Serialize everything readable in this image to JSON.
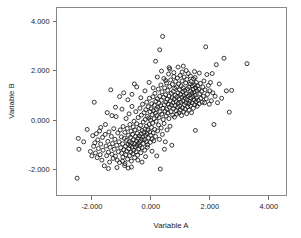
{
  "chart_data": {
    "type": "scatter",
    "title": "",
    "xlabel": "Variable A",
    "ylabel": "Variable B",
    "xlim": [
      -3.2,
      4.6
    ],
    "ylim": [
      -3.05,
      4.55
    ],
    "xticks": [
      -2.0,
      0.0,
      2.0,
      4.0
    ],
    "xticklabels": [
      "-2.000",
      "0.000",
      "2.000",
      "4.000"
    ],
    "yticks": [
      -2.0,
      0.0,
      2.0,
      4.0
    ],
    "yticklabels": [
      "-2.000",
      "0.000",
      "2.000",
      "4.000"
    ],
    "grid": false,
    "legend": null,
    "marker": "open-circle",
    "marker_color": "#161616",
    "marker_size": 3.0,
    "n_points": 392,
    "correlation_approx": 0.66,
    "points": [
      [
        -2.5,
        -2.35
      ],
      [
        -2.46,
        -0.74
      ],
      [
        -2.44,
        -1.18
      ],
      [
        -2.16,
        -0.38
      ],
      [
        -2.05,
        -1.27
      ],
      [
        -2.0,
        -1.45
      ],
      [
        -1.97,
        -0.63
      ],
      [
        -1.94,
        -1.06
      ],
      [
        -1.92,
        0.72
      ],
      [
        -1.9,
        -0.92
      ],
      [
        -1.88,
        -1.33
      ],
      [
        -1.85,
        -0.55
      ],
      [
        -1.82,
        -1.52
      ],
      [
        -1.8,
        -0.8
      ],
      [
        -1.78,
        -1.15
      ],
      [
        -1.74,
        -0.44
      ],
      [
        -1.72,
        -1.4
      ],
      [
        -1.7,
        -0.97
      ],
      [
        -1.66,
        -1.62
      ],
      [
        -1.64,
        -0.7
      ],
      [
        -1.62,
        -1.22
      ],
      [
        -1.58,
        -1.85
      ],
      [
        -1.55,
        -0.58
      ],
      [
        -1.52,
        -1.05
      ],
      [
        -1.5,
        -1.44
      ],
      [
        -1.48,
        0.3
      ],
      [
        -1.46,
        -0.86
      ],
      [
        -1.44,
        -1.3
      ],
      [
        -1.42,
        -0.48
      ],
      [
        -1.4,
        -1.7
      ],
      [
        -1.38,
        -1.1
      ],
      [
        -1.36,
        1.22
      ],
      [
        -1.34,
        -0.66
      ],
      [
        -1.32,
        -1.38
      ],
      [
        -1.3,
        -0.95
      ],
      [
        -1.28,
        -1.55
      ],
      [
        -1.26,
        -0.35
      ],
      [
        -1.24,
        -1.18
      ],
      [
        -1.22,
        -0.78
      ],
      [
        -1.2,
        -1.46
      ],
      [
        -1.18,
        0.14
      ],
      [
        -1.16,
        -1.02
      ],
      [
        -1.14,
        -1.62
      ],
      [
        -1.12,
        -0.52
      ],
      [
        -1.1,
        -1.28
      ],
      [
        -1.08,
        -0.88
      ],
      [
        -1.06,
        -1.72
      ],
      [
        -1.04,
        -0.4
      ],
      [
        -1.02,
        -1.12
      ],
      [
        -1.0,
        -0.68
      ],
      [
        -0.99,
        -1.34
      ],
      [
        -0.98,
        0.44
      ],
      [
        -0.96,
        -0.96
      ],
      [
        -0.95,
        -1.5
      ],
      [
        -0.94,
        -0.26
      ],
      [
        -0.92,
        -1.2
      ],
      [
        -0.9,
        -0.74
      ],
      [
        -0.89,
        -1.84
      ],
      [
        -0.88,
        -0.5
      ],
      [
        -0.86,
        -1.06
      ],
      [
        -0.85,
        -1.4
      ],
      [
        -0.84,
        0.06
      ],
      [
        -0.83,
        -0.82
      ],
      [
        -0.82,
        -1.26
      ],
      [
        -0.8,
        -0.34
      ],
      [
        -0.79,
        -1.58
      ],
      [
        -0.78,
        -0.98
      ],
      [
        -0.77,
        -1.94
      ],
      [
        -0.76,
        -0.62
      ],
      [
        -0.75,
        -1.16
      ],
      [
        -0.74,
        0.25
      ],
      [
        -0.73,
        -0.88
      ],
      [
        -0.72,
        -1.44
      ],
      [
        -0.71,
        -0.18
      ],
      [
        -0.7,
        -1.04
      ],
      [
        -0.69,
        -0.7
      ],
      [
        -0.68,
        -1.3
      ],
      [
        -0.67,
        -0.45
      ],
      [
        -0.66,
        -1.66
      ],
      [
        -0.65,
        -0.92
      ],
      [
        -0.64,
        0.55
      ],
      [
        -0.63,
        -1.1
      ],
      [
        -0.62,
        -0.58
      ],
      [
        -0.61,
        -1.36
      ],
      [
        -0.6,
        -0.28
      ],
      [
        -0.59,
        -0.8
      ],
      [
        -0.58,
        -1.22
      ],
      [
        -0.57,
        -0.05
      ],
      [
        -0.56,
        -0.96
      ],
      [
        -0.55,
        -1.52
      ],
      [
        -0.54,
        -0.4
      ],
      [
        -0.53,
        -1.08
      ],
      [
        -0.52,
        -0.66
      ],
      [
        -0.51,
        0.34
      ],
      [
        -0.5,
        -1.28
      ],
      [
        -0.49,
        -0.84
      ],
      [
        -0.48,
        -0.15
      ],
      [
        -0.47,
        -1.02
      ],
      [
        -0.46,
        -0.54
      ],
      [
        -0.45,
        -1.42
      ],
      [
        -0.44,
        -0.74
      ],
      [
        -0.43,
        0.1
      ],
      [
        -0.42,
        -0.94
      ],
      [
        -0.41,
        -1.16
      ],
      [
        -0.4,
        -0.34
      ],
      [
        -0.39,
        -0.64
      ],
      [
        -0.38,
        -1.05
      ],
      [
        -0.37,
        0.48
      ],
      [
        -0.36,
        -0.86
      ],
      [
        -0.35,
        -0.22
      ],
      [
        -0.34,
        -1.32
      ],
      [
        -0.33,
        -0.56
      ],
      [
        -0.32,
        0.2
      ],
      [
        -0.31,
        -0.78
      ],
      [
        -0.3,
        -1.12
      ],
      [
        -0.29,
        -0.42
      ],
      [
        -0.28,
        0.64
      ],
      [
        -0.27,
        -0.68
      ],
      [
        -0.26,
        -0.08
      ],
      [
        -0.25,
        -0.95
      ],
      [
        -0.24,
        -0.5
      ],
      [
        -0.23,
        0.3
      ],
      [
        -0.22,
        -0.8
      ],
      [
        -0.21,
        -1.22
      ],
      [
        -0.2,
        -0.36
      ],
      [
        -0.19,
        0.02
      ],
      [
        -0.18,
        -0.62
      ],
      [
        -0.17,
        0.42
      ],
      [
        -0.16,
        -0.88
      ],
      [
        -0.15,
        -0.25
      ],
      [
        -0.14,
        0.72
      ],
      [
        -0.13,
        -0.55
      ],
      [
        -0.12,
        0.15
      ],
      [
        -0.11,
        -1.0
      ],
      [
        -0.1,
        -0.4
      ],
      [
        -0.09,
        0.54
      ],
      [
        -0.08,
        -0.72
      ],
      [
        -0.07,
        0.08
      ],
      [
        -0.06,
        -0.18
      ],
      [
        -0.05,
        0.88
      ],
      [
        -0.04,
        -0.48
      ],
      [
        -0.03,
        0.34
      ],
      [
        -0.02,
        -0.9
      ],
      [
        -0.01,
        0.0
      ],
      [
        0.0,
        -0.62
      ],
      [
        0.01,
        0.46
      ],
      [
        0.02,
        -0.3
      ],
      [
        0.03,
        0.66
      ],
      [
        0.04,
        -0.76
      ],
      [
        0.05,
        0.22
      ],
      [
        0.06,
        -0.12
      ],
      [
        0.07,
        0.94
      ],
      [
        0.08,
        -0.52
      ],
      [
        0.09,
        0.38
      ],
      [
        0.1,
        -0.84
      ],
      [
        0.11,
        0.05
      ],
      [
        0.12,
        0.6
      ],
      [
        0.13,
        -0.38
      ],
      [
        0.14,
        1.08
      ],
      [
        0.15,
        0.28
      ],
      [
        0.16,
        -0.66
      ],
      [
        0.17,
        0.76
      ],
      [
        0.18,
        -0.05
      ],
      [
        0.19,
        0.44
      ],
      [
        0.2,
        -1.45
      ],
      [
        0.21,
        0.18
      ],
      [
        0.22,
        0.86
      ],
      [
        0.23,
        -0.44
      ],
      [
        0.24,
        0.52
      ],
      [
        0.25,
        1.25
      ],
      [
        0.26,
        -0.2
      ],
      [
        0.27,
        0.68
      ],
      [
        0.28,
        0.1
      ],
      [
        0.29,
        -0.78
      ],
      [
        0.3,
        0.96
      ],
      [
        0.31,
        0.34
      ],
      [
        0.32,
        -1.98
      ],
      [
        0.33,
        0.58
      ],
      [
        0.34,
        1.42
      ],
      [
        0.35,
        -0.32
      ],
      [
        0.36,
        0.8
      ],
      [
        0.37,
        0.24
      ],
      [
        0.38,
        1.14
      ],
      [
        0.39,
        -0.58
      ],
      [
        0.4,
        3.38
      ],
      [
        0.41,
        0.48
      ],
      [
        0.42,
        0.02
      ],
      [
        0.43,
        0.92
      ],
      [
        0.44,
        1.68
      ],
      [
        0.45,
        -0.14
      ],
      [
        0.46,
        0.62
      ],
      [
        0.47,
        1.3
      ],
      [
        0.48,
        0.36
      ],
      [
        0.49,
        -0.88
      ],
      [
        0.5,
        1.02
      ],
      [
        0.51,
        0.72
      ],
      [
        0.52,
        0.16
      ],
      [
        0.53,
        1.5
      ],
      [
        0.54,
        0.44
      ],
      [
        0.55,
        -0.4
      ],
      [
        0.56,
        0.84
      ],
      [
        0.57,
        1.2
      ],
      [
        0.58,
        0.28
      ],
      [
        0.59,
        0.64
      ],
      [
        0.6,
        1.86
      ],
      [
        0.61,
        0.06
      ],
      [
        0.62,
        0.98
      ],
      [
        0.63,
        0.52
      ],
      [
        0.64,
        1.36
      ],
      [
        0.65,
        -0.25
      ],
      [
        0.66,
        0.78
      ],
      [
        0.67,
        1.62
      ],
      [
        0.68,
        0.34
      ],
      [
        0.69,
        1.08
      ],
      [
        0.7,
        0.6
      ],
      [
        0.71,
        -1.02
      ],
      [
        0.72,
        0.9
      ],
      [
        0.73,
        1.44
      ],
      [
        0.74,
        0.2
      ],
      [
        0.75,
        0.7
      ],
      [
        0.76,
        1.16
      ],
      [
        0.77,
        0.46
      ],
      [
        0.78,
        1.92
      ],
      [
        0.79,
        0.84
      ],
      [
        0.8,
        0.12
      ],
      [
        0.81,
        1.28
      ],
      [
        0.82,
        0.58
      ],
      [
        0.83,
        1.0
      ],
      [
        0.84,
        1.56
      ],
      [
        0.85,
        0.38
      ],
      [
        0.86,
        0.74
      ],
      [
        0.87,
        1.34
      ],
      [
        0.88,
        0.24
      ],
      [
        0.89,
        0.94
      ],
      [
        0.9,
        1.7
      ],
      [
        0.91,
        0.52
      ],
      [
        0.92,
        1.1
      ],
      [
        0.93,
        0.68
      ],
      [
        0.94,
        1.46
      ],
      [
        0.95,
        0.3
      ],
      [
        0.96,
        0.86
      ],
      [
        0.97,
        1.22
      ],
      [
        0.98,
        0.56
      ],
      [
        0.99,
        1.8
      ],
      [
        1.0,
        0.4
      ],
      [
        1.01,
        1.04
      ],
      [
        1.02,
        0.72
      ],
      [
        1.03,
        1.38
      ],
      [
        1.04,
        0.18
      ],
      [
        1.05,
        0.92
      ],
      [
        1.06,
        1.58
      ],
      [
        1.07,
        0.5
      ],
      [
        1.08,
        1.14
      ],
      [
        1.09,
        0.78
      ],
      [
        1.1,
        1.3
      ],
      [
        1.11,
        0.34
      ],
      [
        1.12,
        0.98
      ],
      [
        1.13,
        1.74
      ],
      [
        1.14,
        0.62
      ],
      [
        1.15,
        1.2
      ],
      [
        1.16,
        0.44
      ],
      [
        1.17,
        0.88
      ],
      [
        1.18,
        1.5
      ],
      [
        1.19,
        0.7
      ],
      [
        1.2,
        1.06
      ],
      [
        1.21,
        0.26
      ],
      [
        1.22,
        1.64
      ],
      [
        1.23,
        0.82
      ],
      [
        1.24,
        1.26
      ],
      [
        1.25,
        0.54
      ],
      [
        1.26,
        0.96
      ],
      [
        1.27,
        1.88
      ],
      [
        1.28,
        0.66
      ],
      [
        1.29,
        1.34
      ],
      [
        1.3,
        0.4
      ],
      [
        1.31,
        1.02
      ],
      [
        1.32,
        0.76
      ],
      [
        1.33,
        1.46
      ],
      [
        1.34,
        0.58
      ],
      [
        1.35,
        1.16
      ],
      [
        1.36,
        0.88
      ],
      [
        1.37,
        1.56
      ],
      [
        1.38,
        0.3
      ],
      [
        1.39,
        1.08
      ],
      [
        1.4,
        0.7
      ],
      [
        1.41,
        1.38
      ],
      [
        1.42,
        0.94
      ],
      [
        1.43,
        1.24
      ],
      [
        1.44,
        0.48
      ],
      [
        1.45,
        1.66
      ],
      [
        1.46,
        0.82
      ],
      [
        1.47,
        1.12
      ],
      [
        1.48,
        1.42
      ],
      [
        1.49,
        0.62
      ],
      [
        1.5,
        1.0
      ],
      [
        1.51,
        -0.42
      ],
      [
        1.52,
        1.3
      ],
      [
        1.53,
        0.74
      ],
      [
        1.54,
        1.52
      ],
      [
        1.55,
        0.9
      ],
      [
        1.56,
        1.18
      ],
      [
        1.57,
        0.56
      ],
      [
        1.58,
        1.38
      ],
      [
        1.6,
        0.8
      ],
      [
        1.62,
        1.24
      ],
      [
        1.64,
        0.66
      ],
      [
        1.66,
        1.06
      ],
      [
        1.68,
        1.48
      ],
      [
        1.7,
        0.88
      ],
      [
        1.72,
        1.16
      ],
      [
        1.74,
        0.72
      ],
      [
        1.76,
        1.34
      ],
      [
        1.78,
        0.96
      ],
      [
        1.8,
        1.58
      ],
      [
        1.82,
        0.7
      ],
      [
        1.84,
        1.22
      ],
      [
        1.86,
        2.96
      ],
      [
        1.88,
        0.86
      ],
      [
        1.9,
        1.84
      ],
      [
        1.92,
        1.04
      ],
      [
        1.95,
        1.4
      ],
      [
        1.98,
        0.64
      ],
      [
        2.0,
        1.18
      ],
      [
        2.02,
        1.52
      ],
      [
        2.05,
        0.78
      ],
      [
        2.08,
        1.88
      ],
      [
        2.1,
        1.1
      ],
      [
        2.14,
        -0.18
      ],
      [
        2.18,
        0.96
      ],
      [
        2.22,
        2.24
      ],
      [
        2.26,
        0.7
      ],
      [
        2.32,
        1.46
      ],
      [
        2.4,
        0.88
      ],
      [
        2.48,
        2.5
      ],
      [
        2.56,
        1.18
      ],
      [
        2.66,
        0.32
      ],
      [
        2.74,
        1.2
      ],
      [
        3.26,
        2.28
      ],
      [
        -1.06,
        0.95
      ],
      [
        -0.92,
        1.1
      ],
      [
        -0.78,
        0.82
      ],
      [
        -0.64,
        1.04
      ],
      [
        -0.48,
        1.34
      ],
      [
        -0.34,
        0.9
      ],
      [
        -0.2,
        1.18
      ],
      [
        -0.06,
        1.52
      ],
      [
        0.08,
        1.3
      ],
      [
        0.22,
        1.74
      ],
      [
        0.36,
        1.98
      ],
      [
        0.5,
        1.6
      ],
      [
        0.64,
        2.06
      ],
      [
        0.78,
        1.76
      ],
      [
        0.92,
        2.14
      ],
      [
        1.06,
        1.94
      ],
      [
        1.2,
        2.0
      ],
      [
        1.34,
        1.78
      ],
      [
        1.48,
        1.96
      ],
      [
        0.3,
        2.84
      ],
      [
        0.62,
        2.12
      ],
      [
        -1.2,
        0.52
      ],
      [
        -0.56,
        1.46
      ],
      [
        0.16,
        2.38
      ],
      [
        1.1,
        2.18
      ],
      [
        -0.88,
        -1.76
      ],
      [
        -0.44,
        -1.62
      ],
      [
        -0.18,
        -1.48
      ],
      [
        0.04,
        -1.26
      ],
      [
        -1.32,
        0.18
      ],
      [
        -1.54,
        -0.18
      ],
      [
        -0.3,
        -1.7
      ],
      [
        -0.12,
        -1.1
      ],
      [
        0.46,
        -1.18
      ],
      [
        -1.7,
        -0.3
      ],
      [
        -2.28,
        -0.88
      ],
      [
        -1.44,
        -1.96
      ],
      [
        -0.96,
        -1.66
      ],
      [
        -0.66,
        -1.9
      ],
      [
        -1.15,
        -1.92
      ],
      [
        1.64,
        1.9
      ],
      [
        1.5,
        1.72
      ]
    ]
  },
  "axes": {
    "x_label": "Variable A",
    "y_label": "Variable B"
  }
}
